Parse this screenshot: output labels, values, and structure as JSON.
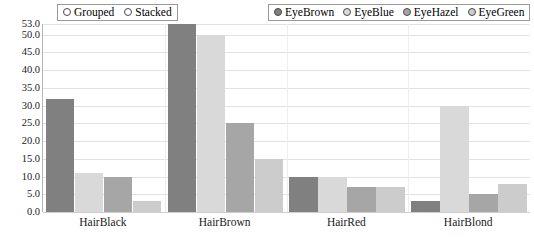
{
  "mode_legend": {
    "name": "display-mode",
    "options": [
      {
        "label": "Grouped",
        "selected": true
      },
      {
        "label": "Stacked",
        "selected": false
      }
    ]
  },
  "series_legend": {
    "name": "eye-color-series",
    "entries": [
      {
        "label": "EyeBrown",
        "color": "#808080"
      },
      {
        "label": "EyeBlue",
        "color": "#d9d9d9"
      },
      {
        "label": "EyeHazel",
        "color": "#a6a6a6"
      },
      {
        "label": "EyeGreen",
        "color": "#cccccc"
      }
    ]
  },
  "chart_data": {
    "type": "bar",
    "title": "",
    "xlabel": "",
    "ylabel": "",
    "grid": true,
    "legend_position": "top",
    "bar_mode": "grouped",
    "ylim": [
      0.0,
      53.0
    ],
    "yticks": [
      "0.0",
      "5.0",
      "10.0",
      "15.0",
      "20.0",
      "25.0",
      "30.0",
      "35.0",
      "40.0",
      "45.0",
      "50.0",
      "53.0"
    ],
    "ytick_values": [
      0.0,
      5.0,
      10.0,
      15.0,
      20.0,
      25.0,
      30.0,
      35.0,
      40.0,
      45.0,
      50.0,
      53.0
    ],
    "categories": [
      "HairBlack",
      "HairBrown",
      "HairRed",
      "HairBlond"
    ],
    "series": [
      {
        "name": "EyeBrown",
        "color": "#808080",
        "values": [
          32,
          53,
          10,
          3
        ]
      },
      {
        "name": "EyeBlue",
        "color": "#d9d9d9",
        "values": [
          11,
          50,
          10,
          30
        ]
      },
      {
        "name": "EyeHazel",
        "color": "#a6a6a6",
        "values": [
          10,
          25,
          7,
          5
        ]
      },
      {
        "name": "EyeGreen",
        "color": "#cccccc",
        "values": [
          3,
          15,
          7,
          8
        ]
      }
    ]
  }
}
